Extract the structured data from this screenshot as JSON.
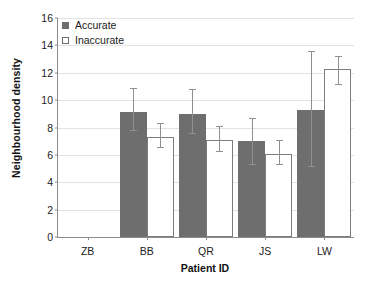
{
  "chart_data": {
    "type": "bar",
    "title": "",
    "xlabel": "Patient ID",
    "ylabel": "Neighbourhood density",
    "categories": [
      "ZB",
      "BB",
      "QR",
      "JS",
      "LW"
    ],
    "ylim": [
      0,
      16
    ],
    "yticks": [
      0,
      2,
      4,
      6,
      8,
      10,
      12,
      14,
      16
    ],
    "grid": true,
    "legend_position": "top-left",
    "series": [
      {
        "name": "Accurate",
        "color": "#6e6e6e",
        "values": [
          null,
          9.1,
          9.0,
          7.0,
          9.3
        ],
        "err_low": [
          null,
          7.8,
          7.6,
          5.3,
          5.2
        ],
        "err_high": [
          null,
          10.9,
          10.8,
          8.7,
          13.6
        ]
      },
      {
        "name": "Inaccurate",
        "color": "#ffffff",
        "values": [
          null,
          7.3,
          7.1,
          6.1,
          12.3
        ],
        "err_low": [
          null,
          6.6,
          6.3,
          5.3,
          11.2
        ],
        "err_high": [
          null,
          8.3,
          8.1,
          7.1,
          13.2
        ]
      }
    ]
  },
  "legend": {
    "items": [
      {
        "label": "Accurate"
      },
      {
        "label": "Inaccurate"
      }
    ]
  },
  "axes": {
    "y_title": "Neighbourhood density",
    "x_title": "Patient ID",
    "y_tick_labels": [
      "0",
      "2",
      "4",
      "6",
      "8",
      "10",
      "12",
      "14",
      "16"
    ],
    "x_tick_labels": [
      "ZB",
      "BB",
      "QR",
      "JS",
      "LW"
    ]
  }
}
